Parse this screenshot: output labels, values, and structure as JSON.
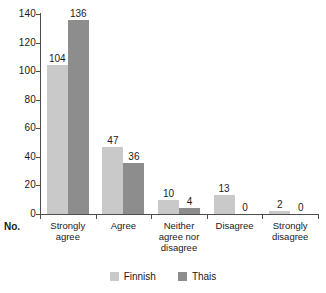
{
  "chart_data": {
    "type": "bar",
    "title": "",
    "xlabel": "",
    "ylabel": "",
    "axis_caption": "No.",
    "categories": [
      "Strongly agree",
      "Agree",
      "Neither agree nor disagree",
      "Disagree",
      "Strongly disagree"
    ],
    "category_lines": [
      [
        "Strongly",
        "agree"
      ],
      [
        "Agree"
      ],
      [
        "Neither",
        "agree nor",
        "disagree"
      ],
      [
        "Disagree"
      ],
      [
        "Strongly",
        "disagree"
      ]
    ],
    "series": [
      {
        "name": "Finnish",
        "color": "#c9c9c9",
        "values": [
          104,
          47,
          10,
          13,
          2
        ]
      },
      {
        "name": "Thais",
        "color": "#8d8d8d",
        "values": [
          136,
          36,
          4,
          0,
          0
        ]
      }
    ],
    "ylim": [
      0,
      140
    ],
    "yticks": [
      0,
      20,
      40,
      60,
      80,
      100,
      120,
      140
    ],
    "ytick_labels": [
      "0",
      "20",
      "40",
      "60",
      "80",
      "100",
      "120",
      "140"
    ],
    "grid": false,
    "legend_position": "bottom",
    "data_labels": [
      [
        "104",
        "136"
      ],
      [
        "47",
        "36"
      ],
      [
        "10",
        "4"
      ],
      [
        "13",
        "0"
      ],
      [
        "2",
        "0"
      ]
    ]
  }
}
